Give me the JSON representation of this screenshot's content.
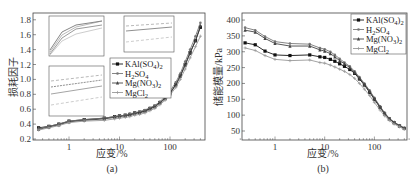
{
  "chart_data": [
    {
      "id": "a",
      "type": "line",
      "caption": "(a)",
      "xlabel": "应变/%",
      "ylabel": "损耗因子",
      "xscale": "log",
      "xlim": [
        0.25,
        450
      ],
      "ylim": [
        0.2,
        1.85
      ],
      "xticks": [
        "1",
        "10",
        "100"
      ],
      "yticks": [
        "0.2",
        "0.4",
        "0.6",
        "0.8",
        "1.0",
        "1.2",
        "1.4",
        "1.6",
        "1.8"
      ],
      "legend_position": "center-right",
      "insets": 3,
      "x": [
        0.25,
        0.4,
        0.63,
        1,
        2,
        5,
        8,
        10,
        13,
        16,
        20,
        25,
        32,
        40,
        50,
        63,
        80,
        100,
        130,
        160,
        200,
        250,
        320,
        400
      ],
      "series": [
        {
          "name": "KAl(SO4)2",
          "color": "#111111",
          "marker": "square",
          "values": [
            0.35,
            0.37,
            0.4,
            0.44,
            0.46,
            0.48,
            0.5,
            0.51,
            0.52,
            0.53,
            0.55,
            0.56,
            0.58,
            0.61,
            0.64,
            0.69,
            0.75,
            0.82,
            0.93,
            1.05,
            1.2,
            1.36,
            1.52,
            1.7
          ]
        },
        {
          "name": "H2SO4",
          "color": "#777777",
          "marker": "dot",
          "values": [
            0.34,
            0.37,
            0.4,
            0.44,
            0.46,
            0.48,
            0.5,
            0.51,
            0.52,
            0.54,
            0.55,
            0.57,
            0.59,
            0.62,
            0.65,
            0.7,
            0.77,
            0.84,
            0.96,
            1.08,
            1.24,
            1.4,
            1.58,
            1.76
          ]
        },
        {
          "name": "Mg(NO3)2",
          "color": "#444444",
          "marker": "triangle",
          "values": [
            0.33,
            0.36,
            0.39,
            0.43,
            0.45,
            0.47,
            0.49,
            0.5,
            0.51,
            0.52,
            0.54,
            0.55,
            0.57,
            0.6,
            0.63,
            0.68,
            0.74,
            0.81,
            0.92,
            1.04,
            1.19,
            1.35,
            1.52,
            1.72
          ]
        },
        {
          "name": "MgCl2",
          "color": "#999999",
          "marker": "plus",
          "values": [
            0.32,
            0.35,
            0.38,
            0.42,
            0.44,
            0.45,
            0.47,
            0.48,
            0.49,
            0.5,
            0.52,
            0.53,
            0.55,
            0.58,
            0.61,
            0.66,
            0.72,
            0.79,
            0.89,
            1.0,
            1.14,
            1.29,
            1.44,
            1.58
          ]
        }
      ]
    },
    {
      "id": "b",
      "type": "line",
      "caption": "(b)",
      "xlabel": "应变/%",
      "ylabel": "储能模量/kPa",
      "xscale": "log",
      "xlim": [
        0.2,
        500
      ],
      "ylim": [
        30,
        420
      ],
      "xticks": [
        "1",
        "10",
        "100"
      ],
      "yticks": [
        "50",
        "100",
        "150",
        "200",
        "250",
        "300",
        "350",
        "400"
      ],
      "legend_position": "upper-right",
      "x": [
        0.25,
        0.4,
        0.63,
        1,
        2,
        5,
        8,
        10,
        13,
        16,
        20,
        25,
        32,
        40,
        50,
        63,
        80,
        100,
        130,
        160,
        200,
        250,
        320,
        400
      ],
      "series": [
        {
          "name": "KAl(SO4)2",
          "color": "#111111",
          "marker": "square",
          "values": [
            328,
            322,
            302,
            290,
            288,
            290,
            284,
            282,
            276,
            270,
            262,
            254,
            244,
            232,
            214,
            195,
            172,
            150,
            124,
            104,
            88,
            76,
            66,
            58
          ]
        },
        {
          "name": "H2SO4",
          "color": "#777777",
          "marker": "dot",
          "values": [
            376,
            368,
            348,
            332,
            326,
            324,
            312,
            308,
            300,
            290,
            278,
            266,
            254,
            238,
            220,
            200,
            178,
            155,
            128,
            108,
            90,
            78,
            68,
            60
          ]
        },
        {
          "name": "Mg(NO3)2",
          "color": "#444444",
          "marker": "triangle",
          "values": [
            368,
            362,
            342,
            326,
            318,
            318,
            306,
            302,
            294,
            284,
            272,
            262,
            250,
            235,
            217,
            197,
            175,
            152,
            126,
            106,
            89,
            77,
            67,
            59
          ]
        },
        {
          "name": "MgCl2",
          "color": "#999999",
          "marker": "plus",
          "values": [
            312,
            304,
            288,
            276,
            272,
            274,
            266,
            264,
            258,
            252,
            245,
            238,
            228,
            216,
            200,
            182,
            162,
            140,
            116,
            98,
            83,
            72,
            63,
            55
          ]
        }
      ]
    }
  ],
  "legend": {
    "items": [
      {
        "base": "KAl(SO",
        "sub1": "4",
        "mid": ")",
        "sub2": "2"
      },
      {
        "base": "H",
        "sub1": "2",
        "mid": "SO",
        "sub2": "4"
      },
      {
        "base": "Mg(NO",
        "sub1": "3",
        "mid": ")",
        "sub2": "2"
      },
      {
        "base": "MgCl",
        "sub1": "2",
        "mid": "",
        "sub2": ""
      }
    ]
  },
  "labels": {
    "a_xlabel": "应变/%",
    "a_ylabel": "损耗因子",
    "a_caption": "(a)",
    "b_xlabel": "应变/%",
    "b_ylabel": "储能模量/kPa",
    "b_caption": "(b)"
  }
}
